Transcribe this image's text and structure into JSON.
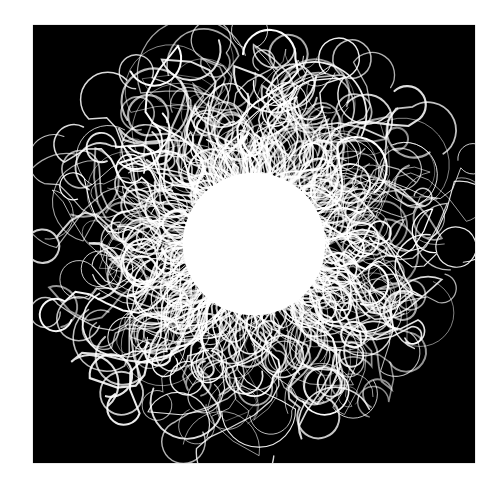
{
  "artwork": {
    "description": "White hairy radial burst on black square",
    "background_color": "#000000",
    "stroke_color": "#ffffff",
    "page_color": "#ffffff",
    "center": [
      221,
      219
    ],
    "core_radius": 95,
    "outer_radius": 180,
    "lobes": 14,
    "strand_count": 420,
    "seed": 7
  }
}
